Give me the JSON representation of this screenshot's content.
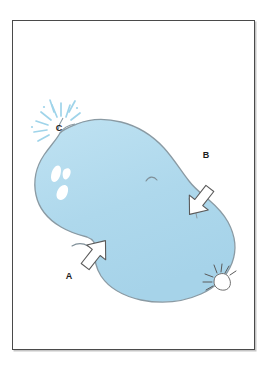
{
  "figure": {
    "title": "Whale body-part labelling diagram",
    "subject": "whale",
    "view": "top view illustration of a whale in light blue with three labelled callout arrows",
    "background_color": "#ffffff",
    "frame": {
      "border_color": "#4a4a4a",
      "shadow_color": "#969696",
      "x": 12,
      "y": 20,
      "width": 243,
      "height": 330
    }
  },
  "colors": {
    "whale_fill": "#aed8ec",
    "whale_fill_light": "#c2e2f1",
    "whale_outline": "#8a9aa3",
    "spray_blue": "#9fd4ea",
    "white_patch": "#ffffff",
    "arrow_outline": "#5a5a5a",
    "arrow_fill": "#ffffff",
    "label_color": "#1c1c1c"
  },
  "labels": [
    {
      "id": "label-a",
      "text": "A",
      "x": 66,
      "y": 266,
      "points_to": "throat / flipper region on the underside of the whale",
      "arrow": {
        "direction": "up-right",
        "tip_x": 92,
        "tip_y": 232
      }
    },
    {
      "id": "label-b",
      "text": "B",
      "x": 203,
      "y": 152,
      "points_to": "back / dorsal region of the whale",
      "arrow": {
        "direction": "down-left",
        "tip_x": 180,
        "tip_y": 177
      }
    },
    {
      "id": "label-c",
      "text": "C",
      "x": 48,
      "y": 126,
      "points_to": "blowhole spout / spray at the top of the head",
      "arrow": {
        "direction": "none",
        "tip_x": 0,
        "tip_y": 0
      }
    }
  ],
  "features": [
    {
      "id": "blowhole-spout",
      "name": "blowhole-spout",
      "description": "radiating light blue spray dashes above the whale's blowhole"
    },
    {
      "id": "white-callosity-patches",
      "name": "white-callosity-patches",
      "description": "three white patches on the whale's head"
    },
    {
      "id": "eye-marking",
      "name": "eye-marking",
      "description": "small curved line on the upper body"
    },
    {
      "id": "belly-crease",
      "name": "belly-crease",
      "description": "short curved crease line on the lower left of the body"
    },
    {
      "id": "tail-fluke",
      "name": "tail-fluke",
      "description": "small tail fluke with splash lines at the lower right of the body"
    }
  ]
}
